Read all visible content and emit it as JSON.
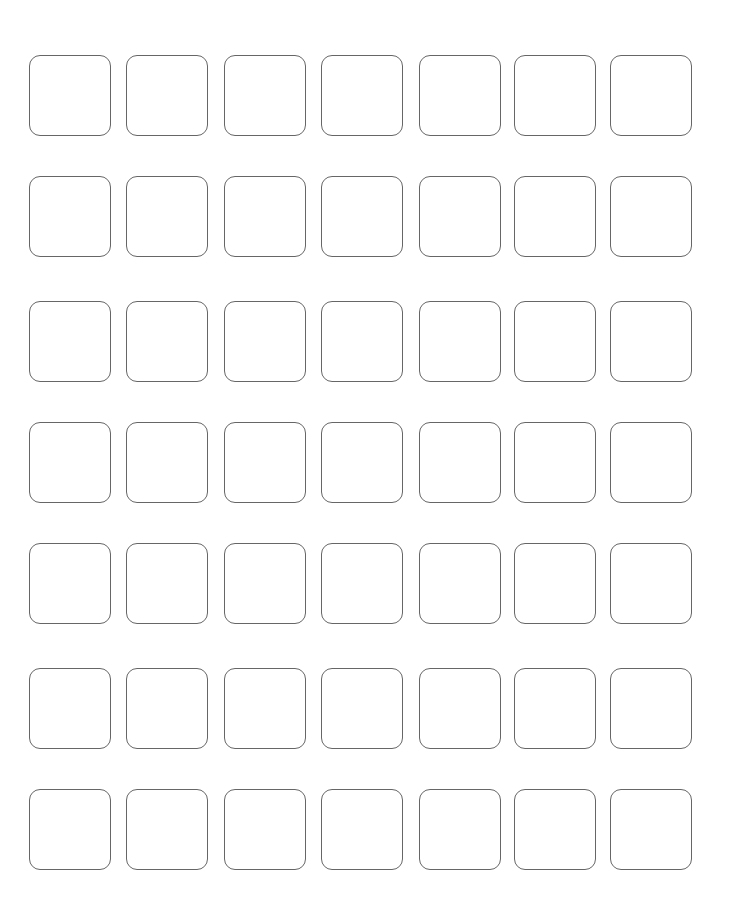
{
  "page": {
    "background_color": "#ffffff",
    "width": 730,
    "height": 921
  },
  "grid": {
    "columns": 7,
    "rows": 7,
    "total_cells": 49,
    "cell": {
      "width": 82,
      "height": 81,
      "corner_radius": 11,
      "border_width": 1,
      "border_color": "#666666",
      "fill_color": "#ffffff"
    },
    "column_x": [
      29,
      126,
      224,
      321,
      419,
      514,
      610
    ],
    "row_y": [
      55,
      176,
      301,
      422,
      543,
      668,
      789
    ],
    "column_pitch": 97,
    "row_pitch": 121,
    "cells": [
      {
        "row": 1,
        "col": 1,
        "label": ""
      },
      {
        "row": 1,
        "col": 2,
        "label": ""
      },
      {
        "row": 1,
        "col": 3,
        "label": ""
      },
      {
        "row": 1,
        "col": 4,
        "label": ""
      },
      {
        "row": 1,
        "col": 5,
        "label": ""
      },
      {
        "row": 1,
        "col": 6,
        "label": ""
      },
      {
        "row": 1,
        "col": 7,
        "label": ""
      },
      {
        "row": 2,
        "col": 1,
        "label": ""
      },
      {
        "row": 2,
        "col": 2,
        "label": ""
      },
      {
        "row": 2,
        "col": 3,
        "label": ""
      },
      {
        "row": 2,
        "col": 4,
        "label": ""
      },
      {
        "row": 2,
        "col": 5,
        "label": ""
      },
      {
        "row": 2,
        "col": 6,
        "label": ""
      },
      {
        "row": 2,
        "col": 7,
        "label": ""
      },
      {
        "row": 3,
        "col": 1,
        "label": ""
      },
      {
        "row": 3,
        "col": 2,
        "label": ""
      },
      {
        "row": 3,
        "col": 3,
        "label": ""
      },
      {
        "row": 3,
        "col": 4,
        "label": ""
      },
      {
        "row": 3,
        "col": 5,
        "label": ""
      },
      {
        "row": 3,
        "col": 6,
        "label": ""
      },
      {
        "row": 3,
        "col": 7,
        "label": ""
      },
      {
        "row": 4,
        "col": 1,
        "label": ""
      },
      {
        "row": 4,
        "col": 2,
        "label": ""
      },
      {
        "row": 4,
        "col": 3,
        "label": ""
      },
      {
        "row": 4,
        "col": 4,
        "label": ""
      },
      {
        "row": 4,
        "col": 5,
        "label": ""
      },
      {
        "row": 4,
        "col": 6,
        "label": ""
      },
      {
        "row": 4,
        "col": 7,
        "label": ""
      },
      {
        "row": 5,
        "col": 1,
        "label": ""
      },
      {
        "row": 5,
        "col": 2,
        "label": ""
      },
      {
        "row": 5,
        "col": 3,
        "label": ""
      },
      {
        "row": 5,
        "col": 4,
        "label": ""
      },
      {
        "row": 5,
        "col": 5,
        "label": ""
      },
      {
        "row": 5,
        "col": 6,
        "label": ""
      },
      {
        "row": 5,
        "col": 7,
        "label": ""
      },
      {
        "row": 6,
        "col": 1,
        "label": ""
      },
      {
        "row": 6,
        "col": 2,
        "label": ""
      },
      {
        "row": 6,
        "col": 3,
        "label": ""
      },
      {
        "row": 6,
        "col": 4,
        "label": ""
      },
      {
        "row": 6,
        "col": 5,
        "label": ""
      },
      {
        "row": 6,
        "col": 6,
        "label": ""
      },
      {
        "row": 6,
        "col": 7,
        "label": ""
      },
      {
        "row": 7,
        "col": 1,
        "label": ""
      },
      {
        "row": 7,
        "col": 2,
        "label": ""
      },
      {
        "row": 7,
        "col": 3,
        "label": ""
      },
      {
        "row": 7,
        "col": 4,
        "label": ""
      },
      {
        "row": 7,
        "col": 5,
        "label": ""
      },
      {
        "row": 7,
        "col": 6,
        "label": ""
      },
      {
        "row": 7,
        "col": 7,
        "label": ""
      }
    ]
  }
}
